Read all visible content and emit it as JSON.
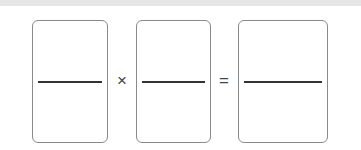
{
  "equation": {
    "fractions": [
      {
        "numerator": "",
        "denominator": ""
      },
      {
        "numerator": "",
        "denominator": ""
      },
      {
        "numerator": "",
        "denominator": ""
      }
    ],
    "operators": {
      "multiply": "×",
      "equals": "="
    }
  },
  "colors": {
    "box_border": "#8a8a8a",
    "fraction_bar": "#333333",
    "background": "#ffffff"
  }
}
